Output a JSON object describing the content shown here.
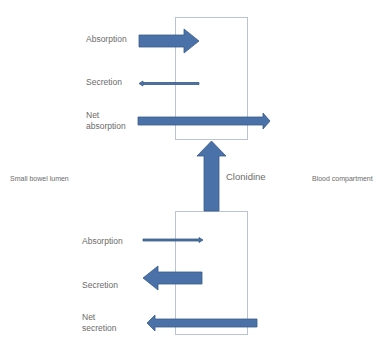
{
  "diagram": {
    "compartments": {
      "left": "Small bowel lumen",
      "right": "Blood compartment"
    },
    "intervention": {
      "label": "Clonidine",
      "direction": "up"
    },
    "top_panel": {
      "rows": [
        {
          "label_lines": [
            "Absorption"
          ],
          "arrow_direction": "right",
          "arrow_weight": "thick"
        },
        {
          "label_lines": [
            "Secretion"
          ],
          "arrow_direction": "left",
          "arrow_weight": "thin"
        },
        {
          "label_lines": [
            "Net",
            "absorption"
          ],
          "arrow_direction": "right",
          "arrow_weight": "medium-long"
        }
      ]
    },
    "bottom_panel": {
      "rows": [
        {
          "label_lines": [
            "Absorption"
          ],
          "arrow_direction": "right",
          "arrow_weight": "thin"
        },
        {
          "label_lines": [
            "Secretion"
          ],
          "arrow_direction": "left",
          "arrow_weight": "thick"
        },
        {
          "label_lines": [
            "Net",
            "secretion"
          ],
          "arrow_direction": "left",
          "arrow_weight": "medium-long"
        }
      ]
    },
    "colors": {
      "arrow_fill": "#4a72a9",
      "arrow_stroke": "#3a5a88",
      "box_border": "#b9c3d2",
      "text": "#6b6b6b"
    }
  }
}
